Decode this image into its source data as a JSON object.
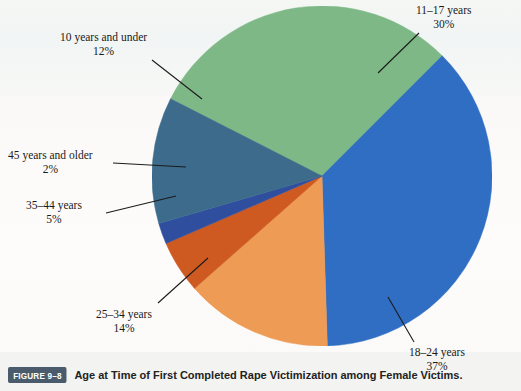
{
  "figure": {
    "badge": "FIGURE 9–8",
    "caption": "Age at Time of First Completed Rape Victimization among Female Victims."
  },
  "chart_data": {
    "type": "pie",
    "title": "Age at Time of First Completed Rape Victimization among Female Victims.",
    "categories": [
      "11–17 years",
      "18–24 years",
      "25–34 years",
      "35–44 years",
      "45 years and older",
      "10 years and under"
    ],
    "values": [
      30,
      37,
      14,
      5,
      2,
      12
    ],
    "unit": "percent",
    "legend": "none",
    "labels_position": "callout",
    "slices": [
      {
        "label": "11–17 years",
        "pct_text": "30%",
        "value": 30,
        "color": "#7eb886"
      },
      {
        "label": "18–24 years",
        "pct_text": "37%",
        "value": 37,
        "color": "#2f6ec2"
      },
      {
        "label": "25–34 years",
        "pct_text": "14%",
        "value": 14,
        "color": "#ee9b56"
      },
      {
        "label": "35–44 years",
        "pct_text": "5%",
        "value": 5,
        "color": "#cf5a21"
      },
      {
        "label": "45 years and older",
        "pct_text": "2%",
        "value": 2,
        "color": "#2f4f9e"
      },
      {
        "label": "10 years and under",
        "pct_text": "12%",
        "value": 12,
        "color": "#3c6b8c"
      }
    ]
  },
  "labels": {
    "l11_17": {
      "name": "11–17 years",
      "pct": "30%"
    },
    "l18_24": {
      "name": "18–24 years",
      "pct": "37%"
    },
    "l25_34": {
      "name": "25–34 years",
      "pct": "14%"
    },
    "l35_44": {
      "name": "35–44 years",
      "pct": "5%"
    },
    "l45_up": {
      "name": "45 years and older",
      "pct": "2%"
    },
    "l10_under": {
      "name": "10 years and under",
      "pct": "12%"
    }
  }
}
